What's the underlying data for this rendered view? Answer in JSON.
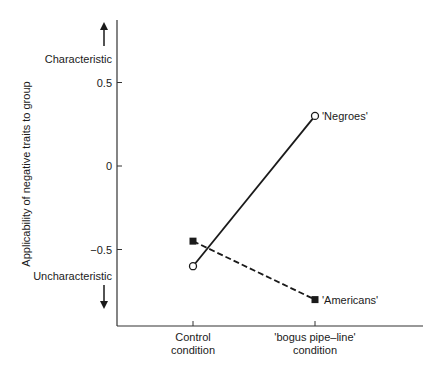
{
  "chart_data": {
    "type": "line",
    "title": "",
    "xlabel": "",
    "ylabel": "Applicability of negative traits to group",
    "categories": [
      "Control condition",
      "'bogus pipe–line' condition"
    ],
    "category_lines": [
      [
        "Control",
        "condition"
      ],
      [
        "'bogus pipe–line'",
        "condition"
      ]
    ],
    "yticks": [
      0.5,
      0,
      -0.5
    ],
    "ytick_labels": [
      "0.5",
      "0",
      "-0.5"
    ],
    "ylim": [
      -1.0,
      0.85
    ],
    "grid": false,
    "annotations": {
      "top": "Characteristic",
      "bottom": "Uncharacteristic"
    },
    "series": [
      {
        "name": "'Negroes'",
        "values": [
          -0.6,
          0.3
        ],
        "marker": "open-circle",
        "line": "solid"
      },
      {
        "name": "'Americans'",
        "values": [
          -0.45,
          -0.8
        ],
        "marker": "filled-square",
        "line": "dashed"
      }
    ]
  }
}
